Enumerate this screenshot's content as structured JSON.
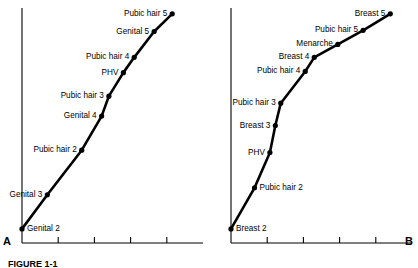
{
  "figure": {
    "caption_label": "FIGURE 1-1",
    "caption_text": "",
    "panels": [
      {
        "id": "A",
        "letter": "A",
        "name": "male-pubertal-sequence",
        "axis": {
          "x_ticks": 4,
          "x_tick_labels": [
            "",
            "",
            "",
            ""
          ],
          "y_tick_labels": [],
          "grid": false
        },
        "events": [
          {
            "label": "Genital 2",
            "x": 0.0,
            "y": 0.06,
            "label_side": "right"
          },
          {
            "label": "Genital 3",
            "x": 0.14,
            "y": 0.205,
            "label_side": "left"
          },
          {
            "label": "Pubic hair 2",
            "x": 0.33,
            "y": 0.395,
            "label_side": "left"
          },
          {
            "label": "Genital 4",
            "x": 0.44,
            "y": 0.54,
            "label_side": "left"
          },
          {
            "label": "Pubic hair 3",
            "x": 0.48,
            "y": 0.625,
            "label_side": "left"
          },
          {
            "label": "PHV",
            "x": 0.56,
            "y": 0.725,
            "label_side": "left"
          },
          {
            "label": "Pubic hair 4",
            "x": 0.62,
            "y": 0.79,
            "label_side": "left"
          },
          {
            "label": "Genital 5",
            "x": 0.73,
            "y": 0.9,
            "label_side": "left"
          },
          {
            "label": "Pubic hair 5",
            "x": 0.83,
            "y": 0.975,
            "label_side": "left"
          }
        ]
      },
      {
        "id": "B",
        "letter": "B",
        "name": "female-pubertal-sequence",
        "axis": {
          "x_ticks": 4,
          "x_tick_labels": [
            "",
            "",
            "",
            ""
          ],
          "y_tick_labels": [],
          "grid": false
        },
        "events": [
          {
            "label": "Breast 2",
            "x": 0.0,
            "y": 0.06,
            "label_side": "right"
          },
          {
            "label": "Pubic hair 2",
            "x": 0.13,
            "y": 0.235,
            "label_side": "right"
          },
          {
            "label": "PHV",
            "x": 0.215,
            "y": 0.385,
            "label_side": "left"
          },
          {
            "label": "Breast 3",
            "x": 0.245,
            "y": 0.5,
            "label_side": "left"
          },
          {
            "label": "Pubic hair 3",
            "x": 0.275,
            "y": 0.595,
            "label_side": "left"
          },
          {
            "label": "Pubic hair 4",
            "x": 0.41,
            "y": 0.73,
            "label_side": "left"
          },
          {
            "label": "Breast 4",
            "x": 0.46,
            "y": 0.79,
            "label_side": "left"
          },
          {
            "label": "Menarche",
            "x": 0.59,
            "y": 0.845,
            "label_side": "left"
          },
          {
            "label": "Pubic hair 5",
            "x": 0.73,
            "y": 0.905,
            "label_side": "left"
          },
          {
            "label": "Breast 5",
            "x": 0.88,
            "y": 0.975,
            "label_side": "left"
          }
        ]
      }
    ]
  },
  "chart_data": {
    "type": "line",
    "xlabel": "",
    "ylabel": "",
    "grid": false,
    "legend": "none",
    "xlim": [
      0,
      1
    ],
    "ylim": [
      0,
      1
    ],
    "charts": [
      {
        "panel": "A",
        "subject": "Male",
        "type": "line",
        "marker": "filled-circle",
        "categories": [
          "Genital 2",
          "Genital 3",
          "Pubic hair 2",
          "Genital 4",
          "Pubic hair 3",
          "PHV",
          "Pubic hair 4",
          "Genital 5",
          "Pubic hair 5"
        ],
        "x": [
          0.0,
          0.14,
          0.33,
          0.44,
          0.48,
          0.56,
          0.62,
          0.73,
          0.83
        ],
        "values": [
          0.06,
          0.205,
          0.395,
          0.54,
          0.625,
          0.725,
          0.79,
          0.9,
          0.975
        ]
      },
      {
        "panel": "B",
        "subject": "Female",
        "type": "line",
        "marker": "filled-circle",
        "categories": [
          "Breast 2",
          "Pubic hair 2",
          "PHV",
          "Breast 3",
          "Pubic hair 3",
          "Pubic hair 4",
          "Breast 4",
          "Menarche",
          "Pubic hair 5",
          "Breast 5"
        ],
        "x": [
          0.0,
          0.13,
          0.215,
          0.245,
          0.275,
          0.41,
          0.46,
          0.59,
          0.73,
          0.88
        ],
        "values": [
          0.06,
          0.235,
          0.385,
          0.5,
          0.595,
          0.73,
          0.79,
          0.845,
          0.905,
          0.975
        ]
      }
    ]
  }
}
